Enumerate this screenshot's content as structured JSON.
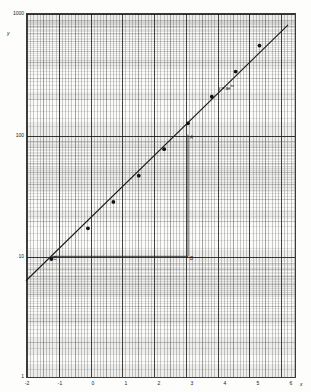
{
  "figure": {
    "kind": "semi-log-graph",
    "paper_color": "#fbfbfa",
    "ink_color": "#1a1a1a",
    "grid_major_color": "#1e1e1e",
    "grid_minor_color": "#464646"
  },
  "axes": {
    "y_name": "y",
    "x_name": "x",
    "y_ticks": [
      "1000",
      "100",
      "10",
      "1"
    ],
    "y_tick_values": [
      1000,
      100,
      10,
      1
    ],
    "x_ticks": [
      "-2",
      "-1",
      "0",
      "1",
      "2",
      "3",
      "4",
      "5",
      "6"
    ],
    "x_tick_values": [
      -2,
      -1,
      0,
      1,
      2,
      3,
      4,
      5,
      6
    ]
  },
  "annotations": {
    "equation": "y = ae",
    "equation_exponent": "bx",
    "point_a": "A",
    "point_b": "B",
    "point_c": "C"
  },
  "chart_data": {
    "type": "scatter",
    "title": "",
    "subtitle": "",
    "xlabel": "x",
    "ylabel": "y",
    "xlim": [
      -2,
      6.5
    ],
    "ylim": [
      1,
      1000
    ],
    "yscale": "log",
    "xscale": "linear",
    "grid": true,
    "legend": false,
    "series": [
      {
        "name": "measured data",
        "marker": "filled-circle",
        "x": [
          -1.2,
          -0.05,
          0.75,
          1.55,
          2.35,
          3.1,
          3.85,
          4.6,
          5.35
        ],
        "y": [
          9.5,
          17,
          28,
          46,
          76,
          124,
          205,
          330,
          540
        ]
      },
      {
        "name": "best-fit exponential",
        "type": "line",
        "equation": "y = ae^(bx)",
        "x": [
          -2.0,
          6.25
        ],
        "y": [
          6.3,
          800
        ]
      }
    ],
    "construction": {
      "description": "slope triangle on semi-log paper",
      "points": [
        {
          "label": "A",
          "x": 3.1,
          "y": 100
        },
        {
          "label": "B",
          "x": 3.1,
          "y": 10
        },
        {
          "label": "C",
          "x": -1.2,
          "y": 10
        }
      ]
    }
  }
}
